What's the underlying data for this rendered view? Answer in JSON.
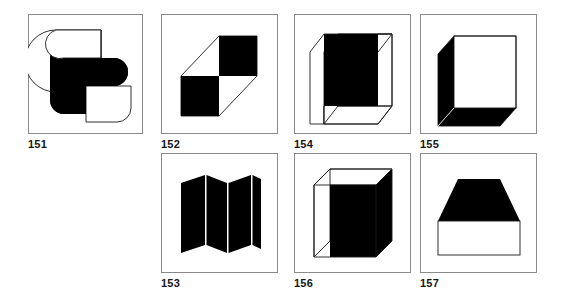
{
  "page": {
    "background_color": "#ffffff",
    "ink_color": "#000000",
    "frame_color": "#8a8a8a",
    "label_color": "#161616"
  },
  "panels": [
    {
      "id": "151",
      "label": "151",
      "description": "Two overlapping rounded-corner square shapes, upper-left one black, lower-right one white outlined",
      "figure_type": "overlapping-rounded-squares",
      "fill": "black-and-white",
      "x": 28,
      "y": 14,
      "w": 115,
      "h": 120,
      "label_x": 28,
      "label_y": 138
    },
    {
      "id": "152",
      "label": "152",
      "description": "Two black squares placed diagonally with thin outline parallelogram connecting their corners",
      "figure_type": "diagonal-checker-squares",
      "fill": "black",
      "x": 161,
      "y": 14,
      "w": 117,
      "h": 120,
      "label_x": 161,
      "label_y": 138
    },
    {
      "id": "154",
      "label": "154",
      "description": "Cube drawn in oblique projection with black front face and white top and left faces",
      "figure_type": "cube-black-front",
      "fill": "black-front",
      "x": 294,
      "y": 14,
      "w": 117,
      "h": 120,
      "label_x": 294,
      "label_y": 138
    },
    {
      "id": "155",
      "label": "155",
      "description": "Cube drawn in oblique projection with white front face and black left and bottom faces",
      "figure_type": "cube-black-sides",
      "fill": "black-sides",
      "x": 420,
      "y": 14,
      "w": 117,
      "h": 120,
      "label_x": 420,
      "label_y": 138
    },
    {
      "id": "153",
      "label": "153",
      "description": "Folded accordion zigzag screen of four black panels with thin white crease lines",
      "figure_type": "accordion-fold",
      "fill": "black",
      "x": 161,
      "y": 153,
      "w": 117,
      "h": 120,
      "label_x": 161,
      "label_y": 277
    },
    {
      "id": "156",
      "label": "156",
      "description": "Upright rectangular box in oblique projection with black front face, white top face and white left side face",
      "figure_type": "box-black-front",
      "fill": "black-front",
      "x": 294,
      "y": 153,
      "w": 117,
      "h": 120,
      "label_x": 294,
      "label_y": 277
    },
    {
      "id": "157",
      "label": "157",
      "description": "Black trapezoid widening downward resting on a white outlined rectangle",
      "figure_type": "trapezoid-on-rectangle",
      "fill": "black-top",
      "x": 420,
      "y": 153,
      "w": 117,
      "h": 120,
      "label_x": 420,
      "label_y": 277
    }
  ]
}
